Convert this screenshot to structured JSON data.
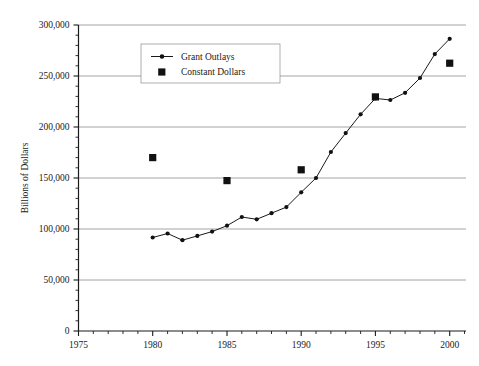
{
  "chart_data": {
    "type": "line",
    "title": "",
    "xlabel": "",
    "ylabel": "Billions of Dollars",
    "xlim": [
      1975,
      2001
    ],
    "ylim": [
      0,
      300000
    ],
    "xticks": [
      1975,
      1980,
      1985,
      1990,
      1995,
      2000
    ],
    "xtick_labels": [
      "1975",
      "1980",
      "1985",
      "1990",
      "1995",
      "2000"
    ],
    "yticks": [
      0,
      50000,
      100000,
      150000,
      200000,
      250000,
      300000
    ],
    "ytick_labels": [
      "0",
      "50,000",
      "100,000",
      "150,000",
      "200,000",
      "250,000",
      "300,000"
    ],
    "minor_tick_interval_x": 1,
    "minor_tick_interval_y": 10000,
    "grid": "horizontal",
    "legend_position": "top-center",
    "series": [
      {
        "name": "Grant Outlays",
        "marker": "diamond",
        "style": "line-with-markers",
        "color": "#111111",
        "x": [
          1980,
          1981,
          1982,
          1983,
          1984,
          1985,
          1986,
          1987,
          1988,
          1989,
          1990,
          1991,
          1992,
          1993,
          1994,
          1995,
          1996,
          1997,
          1998,
          1999,
          2000
        ],
        "values": [
          91700,
          95600,
          89000,
          93200,
          97500,
          103200,
          111800,
          109500,
          115500,
          121500,
          136000,
          150000,
          175500,
          194000,
          212500,
          228000,
          226500,
          233500,
          248000,
          271500,
          286500
        ]
      },
      {
        "name": "Constant Dollars",
        "marker": "square",
        "style": "markers-only",
        "color": "#111111",
        "x": [
          1980,
          1985,
          1990,
          1995,
          2000
        ],
        "values": [
          170000,
          147500,
          158000,
          229500,
          262500
        ]
      }
    ]
  },
  "legend": {
    "entries": [
      {
        "label": "Grant Outlays",
        "marker": "line-diamond-marker"
      },
      {
        "label": "Constant Dollars",
        "marker": "filled-square-marker"
      }
    ]
  },
  "axes": {
    "y_title": "Billions of Dollars"
  }
}
